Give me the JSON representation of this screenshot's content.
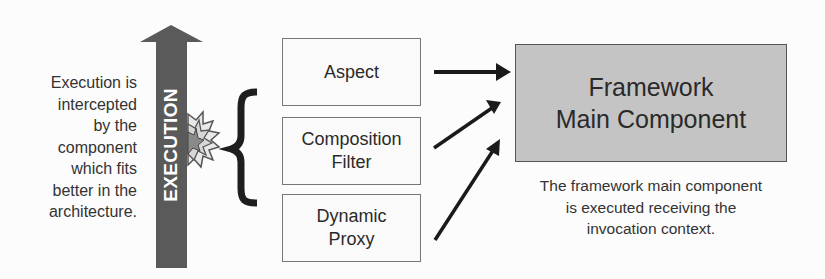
{
  "left_caption": [
    "Execution is",
    "intercepted",
    "by the",
    "component",
    "which fits",
    "better in the",
    "architecture."
  ],
  "execution_arrow": {
    "label": "EXECUTION",
    "color": "#5a5a5a"
  },
  "interceptors": [
    {
      "lines": [
        "Aspect"
      ]
    },
    {
      "lines": [
        "Composition",
        "Filter"
      ]
    },
    {
      "lines": [
        "Dynamic",
        "Proxy"
      ]
    }
  ],
  "main_component": {
    "lines": [
      "Framework",
      "Main Component"
    ],
    "fill": "#c4c4c4"
  },
  "right_caption": [
    "The framework main component",
    "is executed receiving the",
    "invocation context."
  ],
  "icons": {
    "burst": "explosion-burst-icon",
    "brace": "left-curly-brace"
  }
}
